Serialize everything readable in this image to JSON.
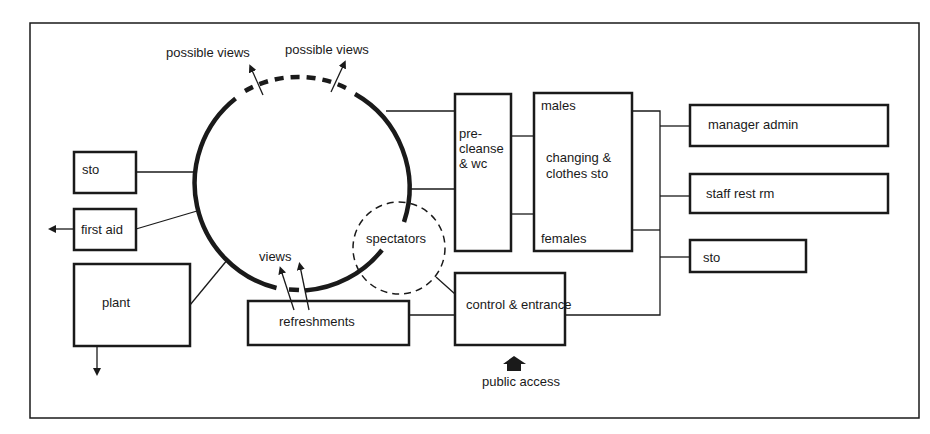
{
  "diagram": {
    "type": "relationship-diagram",
    "colors": {
      "ink": "#1a1a1a",
      "background": "#ffffff"
    },
    "pool": {
      "shape": "circle",
      "note": "solid outline with dashed segments where views are possible"
    },
    "labels": {
      "possible_views_left": "possible views",
      "possible_views_right": "possible views",
      "views": "views",
      "spectators": "spectators",
      "public_access": "public access"
    },
    "rooms": {
      "sto_left": "sto",
      "first_aid": "first aid",
      "plant": "plant",
      "refreshments": "refreshments",
      "pre_cleanse_line1": "pre-",
      "pre_cleanse_line2": "cleanse",
      "pre_cleanse_line3": "& wc",
      "changing_males": "males",
      "changing_line1": "changing &",
      "changing_line2": "clothes sto",
      "changing_females": "females",
      "control_entrance": "control & entrance",
      "manager_admin": "manager admin",
      "staff_rest": "staff rest rm",
      "sto_right": "sto"
    }
  }
}
